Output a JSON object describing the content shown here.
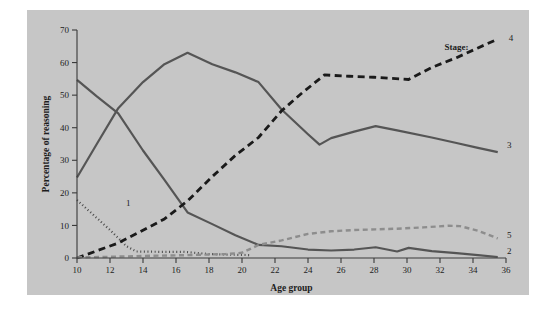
{
  "chart_data": {
    "type": "line",
    "title": "",
    "xlabel": "Age group",
    "ylabel": "Percentage of reasoning",
    "xlim": [
      10,
      36
    ],
    "ylim": [
      0,
      70
    ],
    "xticks": [
      10,
      12,
      14,
      16,
      18,
      20,
      22,
      24,
      26,
      28,
      30,
      32,
      34,
      36
    ],
    "yticks": [
      0,
      10,
      20,
      30,
      40,
      50,
      60,
      70
    ],
    "grid": false,
    "legend_position": "right-inline",
    "legend_title": "Stage:",
    "series": [
      {
        "name": "1",
        "label": "1",
        "style": "dotted",
        "color": "#4a4a4a",
        "width": 2.2,
        "dash": "1,2.6",
        "label_x": 13.1,
        "label_y": 17.0,
        "x": [
          10,
          11,
          12,
          13,
          13.6,
          15,
          16.5,
          18,
          19.5,
          20.5
        ],
        "y": [
          17.8,
          13.2,
          8.6,
          3.6,
          2.0,
          1.9,
          1.9,
          1.2,
          1.0,
          0.9
        ]
      },
      {
        "name": "2",
        "label": "2",
        "style": "solid",
        "color": "#555555",
        "width": 2.2,
        "dash": "",
        "label_x": 36.2,
        "label_y": 2.2,
        "x": [
          10,
          11.2,
          12.5,
          14,
          15.3,
          16.7,
          18.2,
          19.6,
          21,
          22.4,
          24,
          25.4,
          26.8,
          28.1,
          29.4,
          30.1,
          31.5,
          33,
          34.3,
          35.5
        ],
        "y": [
          54.7,
          49.6,
          44.4,
          33.0,
          24.0,
          14.0,
          10.4,
          7.0,
          4.0,
          3.6,
          2.6,
          2.3,
          2.6,
          3.3,
          2.0,
          3.1,
          2.1,
          1.5,
          0.9,
          0.3
        ]
      },
      {
        "name": "3",
        "label": "3",
        "style": "solid",
        "color": "#555555",
        "width": 2.2,
        "dash": "",
        "label_x": 36.2,
        "label_y": 34.6,
        "x": [
          10,
          11.2,
          12.5,
          14,
          15.3,
          16.7,
          18.2,
          19.6,
          21,
          22.4,
          24,
          24.7,
          25.4,
          26.8,
          28.1,
          29.4,
          31.5,
          33,
          34.3,
          35.5
        ],
        "y": [
          24.7,
          35.0,
          46.0,
          54.0,
          59.5,
          63.0,
          59.5,
          57.0,
          54.0,
          45.6,
          38.0,
          34.8,
          36.8,
          38.8,
          40.5,
          39.2,
          37.0,
          35.3,
          33.8,
          32.5
        ]
      },
      {
        "name": "4",
        "label": "4",
        "style": "dashed",
        "color": "#1a1a1a",
        "width": 2.8,
        "dash": "7,4.5",
        "label_x": 36.3,
        "label_y": 67.5,
        "x": [
          10,
          11.2,
          12.5,
          14,
          15.3,
          16.7,
          18.2,
          19.6,
          21,
          22.4,
          23.6,
          25,
          26.5,
          28,
          30.1,
          31.5,
          33,
          34.3,
          35.5
        ],
        "y": [
          0.0,
          2.2,
          4.6,
          8.5,
          12.0,
          17.5,
          25.0,
          31.5,
          37.0,
          45.2,
          50.5,
          56.2,
          55.8,
          55.5,
          54.8,
          58.5,
          61.5,
          64.5,
          67.2
        ]
      },
      {
        "name": "5",
        "label": "5",
        "style": "dashed",
        "color": "#8d8d8d",
        "width": 2.4,
        "dash": "5,3.5",
        "label_x": 36.2,
        "label_y": 7.2,
        "x": [
          10,
          11.5,
          13,
          14.5,
          16,
          17.5,
          19,
          20,
          21,
          22.4,
          24,
          25.4,
          26.8,
          28.1,
          29.4,
          31,
          32.5,
          33.2,
          34.3,
          35.5
        ],
        "y": [
          0.2,
          0.3,
          0.5,
          0.7,
          0.8,
          1.0,
          1.2,
          1.6,
          4.0,
          5.4,
          7.4,
          8.2,
          8.6,
          8.8,
          9.0,
          9.4,
          9.9,
          9.8,
          8.4,
          6.0
        ]
      }
    ]
  },
  "axes": {
    "xlabel": "Age group",
    "ylabel": "Percentage of reasoning",
    "xticks": [
      "10",
      "12",
      "14",
      "16",
      "18",
      "20",
      "22",
      "24",
      "26",
      "28",
      "30",
      "32",
      "34",
      "36"
    ],
    "yticks": [
      "0",
      "10",
      "20",
      "30",
      "40",
      "50",
      "60",
      "70"
    ]
  },
  "legend": {
    "title": "Stage:",
    "entries": [
      "1",
      "2",
      "3",
      "4",
      "5"
    ]
  }
}
